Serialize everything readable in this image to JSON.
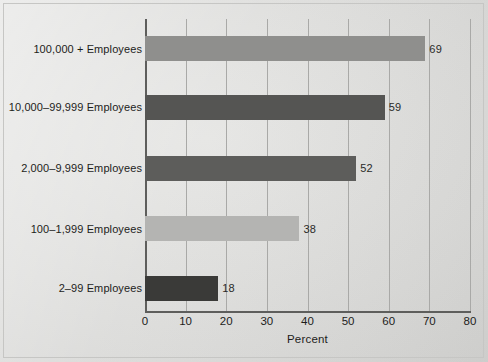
{
  "chart_data": {
    "type": "bar",
    "orientation": "horizontal",
    "title": "",
    "subtitle": "",
    "xlabel": "Percent",
    "ylabel": "",
    "xlim": [
      0,
      80
    ],
    "xticks": [
      0,
      10,
      20,
      30,
      40,
      50,
      60,
      70,
      80
    ],
    "xtick_labels": [
      "0",
      "10",
      "20",
      "30",
      "40",
      "50",
      "60",
      "70",
      "80"
    ],
    "grid": "vertical",
    "legend": "none",
    "categories": [
      "100,000 + Employees",
      "10,000–99,999 Employees",
      "2,000–9,999 Employees",
      "100–1,999 Employees",
      "2–99 Employees"
    ],
    "values": [
      69,
      59,
      52,
      38,
      18
    ],
    "value_labels": [
      "69",
      "59",
      "52",
      "38",
      "18"
    ],
    "bar_colors": [
      "#8f8f8d",
      "#555553",
      "#5d5d5b",
      "#b4b4b2",
      "#3a3a38"
    ],
    "background_color": "#dcdcdb",
    "axis_color": "#5e5e5c",
    "gridline_color": "#a9a9a7",
    "text_color": "#1d1d1b"
  }
}
